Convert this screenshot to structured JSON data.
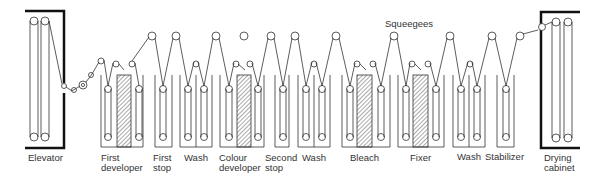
{
  "diagram": {
    "annotation": "Squeegees",
    "stages": [
      {
        "line1": "Elevator",
        "line2": ""
      },
      {
        "line1": "First",
        "line2": "developer"
      },
      {
        "line1": "First",
        "line2": "stop"
      },
      {
        "line1": "Wash",
        "line2": ""
      },
      {
        "line1": "Colour",
        "line2": "developer"
      },
      {
        "line1": "Second",
        "line2": "stop"
      },
      {
        "line1": "Wash",
        "line2": ""
      },
      {
        "line1": "Bleach",
        "line2": ""
      },
      {
        "line1": "Fixer",
        "line2": ""
      },
      {
        "line1": "Wash",
        "line2": ""
      },
      {
        "line1": "Stabilizer",
        "line2": ""
      },
      {
        "line1": "Drying",
        "line2": "cabinet"
      }
    ],
    "colors": {
      "line": "#333333",
      "frame": "#111111",
      "hatch": "#555555",
      "text": "#333333"
    }
  }
}
